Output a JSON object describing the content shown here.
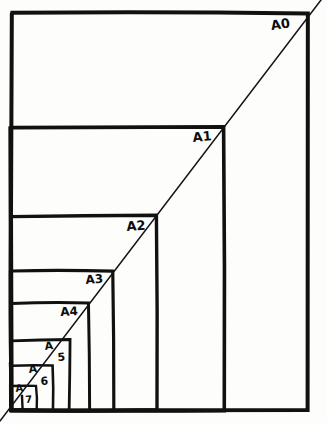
{
  "figure": {
    "background_color": "#fdfdfc",
    "ink_color": "#111111",
    "style": "hand-drawn"
  },
  "chart_data": {
    "type": "diagram",
    "subtype": "nested-rectangles",
    "xlabel": "",
    "ylabel": "",
    "grid": false,
    "legend": false,
    "canvas": {
      "width": 327,
      "height": 423
    },
    "origin_corner": {
      "x": 11,
      "y": 410,
      "label": "bottom-left"
    },
    "diagonal": {
      "from": {
        "x": 0,
        "y": 421
      },
      "to": {
        "x": 321,
        "y": 0
      },
      "passes_through_corners": true,
      "stroke_width": 1.5
    },
    "categories": [
      "A0",
      "A1",
      "A2",
      "A3",
      "A4",
      "A5",
      "A6",
      "A7"
    ],
    "rectangles": [
      {
        "name": "A0",
        "x": 11,
        "y": 13,
        "width": 296,
        "height": 397,
        "stroke_width": 4.0
      },
      {
        "name": "A1",
        "x": 11,
        "y": 127,
        "width": 213,
        "height": 283,
        "stroke_width": 3.6
      },
      {
        "name": "A2",
        "x": 11,
        "y": 216,
        "width": 146,
        "height": 194,
        "stroke_width": 3.4
      },
      {
        "name": "A3",
        "x": 11,
        "y": 271,
        "width": 102,
        "height": 139,
        "stroke_width": 3.2
      },
      {
        "name": "A4",
        "x": 11,
        "y": 303,
        "width": 78,
        "height": 107,
        "stroke_width": 3.0
      },
      {
        "name": "A5",
        "x": 11,
        "y": 340,
        "width": 59,
        "height": 70,
        "stroke_width": 2.8
      },
      {
        "name": "A6",
        "x": 11,
        "y": 365,
        "width": 42,
        "height": 45,
        "stroke_width": 2.6
      },
      {
        "name": "A7",
        "x": 11,
        "y": 386,
        "width": 25,
        "height": 24,
        "stroke_width": 2.4
      }
    ],
    "extra_verticals": [
      {
        "x": 22,
        "y_top": 396,
        "y_bottom": 410
      }
    ],
    "labels": [
      {
        "text": "A0",
        "x": 270,
        "y": 19,
        "font_size": 13,
        "rotation": -8,
        "split": false
      },
      {
        "text": "A1",
        "x": 192,
        "y": 131,
        "font_size": 13,
        "rotation": -5,
        "split": false
      },
      {
        "text": "A2",
        "x": 126,
        "y": 220,
        "font_size": 13,
        "rotation": -4,
        "split": false
      },
      {
        "text": "A3",
        "x": 85,
        "y": 274,
        "font_size": 12,
        "rotation": -4,
        "split": false
      },
      {
        "text": "A4",
        "x": 60,
        "y": 306,
        "font_size": 12,
        "rotation": -3,
        "split": false
      },
      {
        "text": "A",
        "x": 44,
        "y": 341,
        "font_size": 11,
        "rotation": -6,
        "split": true
      },
      {
        "text": "5",
        "x": 57,
        "y": 352,
        "font_size": 11,
        "rotation": -4,
        "split": true
      },
      {
        "text": "A",
        "x": 28,
        "y": 364,
        "font_size": 11,
        "rotation": -6,
        "split": true
      },
      {
        "text": "6",
        "x": 40,
        "y": 376,
        "font_size": 11,
        "rotation": -4,
        "split": true
      },
      {
        "text": "A",
        "x": 15,
        "y": 384,
        "font_size": 10,
        "rotation": -6,
        "split": true
      },
      {
        "text": "7",
        "x": 25,
        "y": 395,
        "font_size": 10,
        "rotation": -4,
        "split": true
      }
    ],
    "series": [
      {
        "name": "relative area (A0 = 1)",
        "values": [
          1,
          0.5,
          0.25,
          0.125,
          0.0625,
          0.03125,
          0.015625,
          0.0078125
        ]
      },
      {
        "name": "drawn width (px)",
        "values": [
          296,
          213,
          146,
          102,
          78,
          59,
          42,
          25
        ]
      },
      {
        "name": "drawn height (px)",
        "values": [
          397,
          283,
          194,
          139,
          107,
          70,
          45,
          24
        ]
      }
    ]
  }
}
